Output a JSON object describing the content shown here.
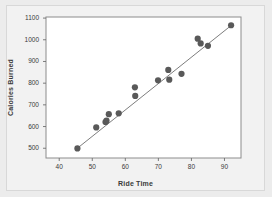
{
  "figure": {
    "background_color": "#ececec",
    "panel_color": "#f2f2f2",
    "plot_area_color": "#ffffff",
    "frame_color": "#8c8c8c"
  },
  "chart_data": {
    "type": "scatter",
    "title": "",
    "xlabel": "Ride Time",
    "ylabel": "Calories Burned",
    "xlim": [
      36,
      95
    ],
    "ylim": [
      455,
      1105
    ],
    "xticks": [
      40,
      50,
      60,
      70,
      80,
      90
    ],
    "yticks": [
      500,
      600,
      700,
      800,
      900,
      1000,
      1100
    ],
    "xtick_labels": [
      "40",
      "50",
      "60",
      "70",
      "80",
      "90"
    ],
    "ytick_labels": [
      "500",
      "600",
      "700",
      "800",
      "900",
      "1000",
      "1100"
    ],
    "grid": false,
    "legend": false,
    "marker_color": "#595959",
    "marker_size": 3.1,
    "trendline": {
      "visible": true,
      "color": "#6e6e6e",
      "x_start": 45.0,
      "y_start": 494,
      "x_end": 92.2,
      "y_end": 1068
    },
    "x": [
      45.5,
      51.2,
      54.0,
      54.3,
      55.0,
      58.0,
      62.9,
      63.0,
      69.9,
      73.0,
      73.3,
      77.0,
      81.9,
      82.8,
      85.0,
      92.0
    ],
    "y": [
      499,
      596,
      621,
      627,
      657,
      661,
      781,
      741,
      813,
      861,
      816,
      843,
      1005,
      983,
      972,
      1067
    ],
    "points": [
      {
        "x": 45.5,
        "y": 499
      },
      {
        "x": 51.2,
        "y": 596
      },
      {
        "x": 54.0,
        "y": 621
      },
      {
        "x": 54.3,
        "y": 627
      },
      {
        "x": 55.0,
        "y": 657
      },
      {
        "x": 58.0,
        "y": 661
      },
      {
        "x": 62.9,
        "y": 781
      },
      {
        "x": 63.0,
        "y": 741
      },
      {
        "x": 69.9,
        "y": 813
      },
      {
        "x": 73.0,
        "y": 861
      },
      {
        "x": 73.3,
        "y": 816
      },
      {
        "x": 77.0,
        "y": 843
      },
      {
        "x": 81.9,
        "y": 1005
      },
      {
        "x": 82.8,
        "y": 983
      },
      {
        "x": 85.0,
        "y": 972
      },
      {
        "x": 92.0,
        "y": 1067
      }
    ]
  }
}
